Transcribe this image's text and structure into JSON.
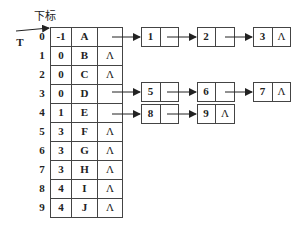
{
  "labels": {
    "index_header": "下标",
    "pointer": "T",
    "null_symbol": "Λ"
  },
  "table": {
    "rows": [
      {
        "index": "0",
        "parent": "-1",
        "data": "A",
        "child": "ptr"
      },
      {
        "index": "1",
        "parent": "0",
        "data": "B",
        "child": "Λ"
      },
      {
        "index": "2",
        "parent": "0",
        "data": "C",
        "child": "Λ"
      },
      {
        "index": "3",
        "parent": "0",
        "data": "D",
        "child": "ptr"
      },
      {
        "index": "4",
        "parent": "1",
        "data": "E",
        "child": "ptr"
      },
      {
        "index": "5",
        "parent": "3",
        "data": "F",
        "child": "Λ"
      },
      {
        "index": "6",
        "parent": "3",
        "data": "G",
        "child": "Λ"
      },
      {
        "index": "7",
        "parent": "3",
        "data": "H",
        "child": "Λ"
      },
      {
        "index": "8",
        "parent": "4",
        "data": "I",
        "child": "Λ"
      },
      {
        "index": "9",
        "parent": "4",
        "data": "J",
        "child": "Λ"
      }
    ]
  },
  "lists": [
    {
      "from_row": "0",
      "nodes": [
        "1",
        "2",
        "3"
      ]
    },
    {
      "from_row": "3",
      "nodes": [
        "5",
        "6",
        "7"
      ]
    },
    {
      "from_row": "4",
      "nodes": [
        "8",
        "9"
      ]
    }
  ]
}
